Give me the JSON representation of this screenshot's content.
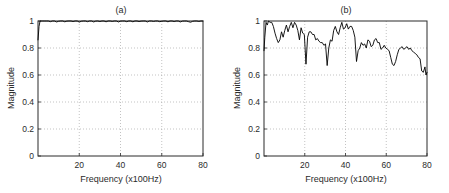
{
  "figure": {
    "background_color": "#ffffff",
    "line_color": "#000000",
    "grid_color": "#9a9a9a",
    "axis_color": "#2b2b2b"
  },
  "panels": [
    {
      "id": "a",
      "title": "(a)",
      "xlabel": "Frequency (x100Hz)",
      "ylabel": "Magnitude"
    },
    {
      "id": "b",
      "title": "(b)",
      "xlabel": "Frequency (x100Hz)",
      "ylabel": "Magnitude"
    }
  ],
  "axis": {
    "x_ticks": [
      "20",
      "40",
      "60",
      "80"
    ],
    "x_tick_values": [
      20,
      40,
      60,
      80
    ],
    "y_ticks": [
      "0",
      "0.2",
      "0.4",
      "0.6",
      "0.8",
      "1"
    ],
    "y_tick_values": [
      0,
      0.2,
      0.4,
      0.6,
      0.8,
      1
    ]
  },
  "chart_data": [
    {
      "type": "line",
      "panel": "a",
      "title": "(a)",
      "xlabel": "Frequency (x100Hz)",
      "ylabel": "Magnitude",
      "xlim": [
        0,
        80
      ],
      "ylim": [
        0,
        1
      ],
      "grid": true,
      "legend": "none",
      "x": [
        0,
        0.5,
        1,
        2,
        3,
        4,
        5,
        6,
        7,
        8,
        9,
        10,
        11,
        12,
        13,
        14,
        15,
        16,
        17,
        18,
        19,
        20,
        21,
        22,
        23,
        24,
        25,
        26,
        27,
        28,
        29,
        30,
        31,
        32,
        33,
        34,
        35,
        36,
        37,
        38,
        39,
        40,
        41,
        42,
        43,
        44,
        45,
        46,
        47,
        48,
        49,
        50,
        51,
        52,
        53,
        54,
        55,
        56,
        57,
        58,
        59,
        60,
        61,
        62,
        63,
        64,
        65,
        66,
        67,
        68,
        69,
        70,
        71,
        72,
        73,
        74,
        75,
        76,
        77,
        78,
        79,
        80
      ],
      "y": [
        0.86,
        0.96,
        1.0,
        1.0,
        1.0,
        1.0,
        1.0,
        0.995,
        1.0,
        1.0,
        0.993,
        0.998,
        1.0,
        1.0,
        0.994,
        0.999,
        1.0,
        1.0,
        0.996,
        1.0,
        1.0,
        0.992,
        0.998,
        1.0,
        1.0,
        0.995,
        1.0,
        1.0,
        0.993,
        0.999,
        1.0,
        0.996,
        1.0,
        1.0,
        0.994,
        1.0,
        1.0,
        0.997,
        1.0,
        1.0,
        0.993,
        0.999,
        1.0,
        1.0,
        0.995,
        1.0,
        1.0,
        0.994,
        1.0,
        1.0,
        0.996,
        0.999,
        1.0,
        1.0,
        0.993,
        1.0,
        1.0,
        0.997,
        1.0,
        1.0,
        0.995,
        0.998,
        1.0,
        1.0,
        0.994,
        1.0,
        1.0,
        0.996,
        1.0,
        1.0,
        0.993,
        0.999,
        1.0,
        1.0,
        0.995,
        0.991,
        0.998,
        1.0,
        1.0,
        0.997,
        1.0,
        1.0
      ]
    },
    {
      "type": "line",
      "panel": "b",
      "title": "(b)",
      "xlabel": "Frequency (x100Hz)",
      "ylabel": "Magnitude",
      "xlim": [
        0,
        80
      ],
      "ylim": [
        0,
        1
      ],
      "grid": true,
      "legend": "none",
      "x": [
        0,
        0.4,
        1,
        1.6,
        2.2,
        3,
        3.8,
        4.6,
        5.4,
        6.2,
        7,
        7.8,
        8.6,
        9.4,
        10.2,
        11,
        11.8,
        12.6,
        13.4,
        14.2,
        15,
        15.8,
        16.6,
        17.4,
        18.2,
        19,
        19.8,
        20.6,
        21.4,
        22.2,
        23,
        23.8,
        24.6,
        25.4,
        26.2,
        27,
        27.8,
        28.6,
        29.4,
        30.2,
        31,
        31.8,
        32.6,
        33.4,
        34.2,
        35,
        35.8,
        36.6,
        37.4,
        38.2,
        39,
        39.8,
        40.6,
        41.4,
        42.2,
        43,
        43.8,
        44.6,
        45.4,
        46.2,
        47,
        47.8,
        48.6,
        49.4,
        50.2,
        51,
        51.8,
        52.6,
        53.4,
        54.2,
        55,
        55.8,
        56.6,
        57.4,
        58.2,
        59,
        59.8,
        60.6,
        61.4,
        62.2,
        63,
        63.8,
        64.6,
        65.4,
        66.2,
        67,
        67.8,
        68.6,
        69.4,
        70.2,
        71,
        71.8,
        72.6,
        73.4,
        74.2,
        75,
        75.8,
        76.6,
        77.4,
        78.2,
        79,
        79.5,
        80
      ],
      "y": [
        0.78,
        0.88,
        0.99,
        0.97,
        1.0,
        0.99,
        0.99,
        0.96,
        0.91,
        0.87,
        0.84,
        0.86,
        0.92,
        0.88,
        0.93,
        0.97,
        0.92,
        0.96,
        0.99,
        0.95,
        0.99,
        0.97,
        0.93,
        0.86,
        0.95,
        0.91,
        0.9,
        0.68,
        0.88,
        0.92,
        0.92,
        0.9,
        0.9,
        0.86,
        0.87,
        0.85,
        0.84,
        0.84,
        0.82,
        0.83,
        0.67,
        0.8,
        0.86,
        0.85,
        0.93,
        0.96,
        0.92,
        0.9,
        0.95,
        0.99,
        0.94,
        0.95,
        0.98,
        0.94,
        0.96,
        0.96,
        0.93,
        0.88,
        0.7,
        0.78,
        0.8,
        0.84,
        0.82,
        0.83,
        0.8,
        0.86,
        0.85,
        0.81,
        0.82,
        0.86,
        0.87,
        0.84,
        0.84,
        0.79,
        0.8,
        0.82,
        0.8,
        0.79,
        0.78,
        0.73,
        0.68,
        0.67,
        0.7,
        0.75,
        0.79,
        0.8,
        0.81,
        0.79,
        0.8,
        0.81,
        0.79,
        0.8,
        0.78,
        0.77,
        0.76,
        0.75,
        0.73,
        0.72,
        0.63,
        0.62,
        0.66,
        0.6,
        0.62
      ]
    }
  ]
}
